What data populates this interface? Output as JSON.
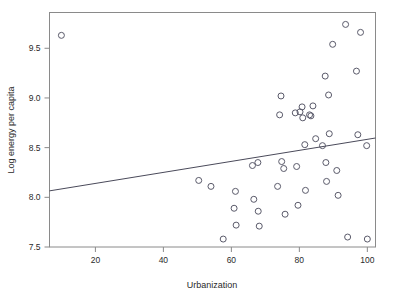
{
  "chart_data": {
    "type": "scatter",
    "title": "",
    "xlabel": "Urbanization",
    "ylabel": "Log energy per capita",
    "xlim": [
      6.5,
      102.4
    ],
    "ylim": [
      7.5,
      9.86
    ],
    "grid": false,
    "legend": null,
    "xticks": [
      20,
      40,
      60,
      80,
      100
    ],
    "xtick_labels": [
      "20",
      "40",
      "60",
      "80",
      "100"
    ],
    "yticks": [
      7.5,
      8.0,
      8.5,
      9.0,
      9.5
    ],
    "ytick_labels": [
      "7.5",
      "8.0",
      "8.5",
      "9.0",
      "9.5"
    ],
    "marker": "open-circle",
    "marker_color": "#5a5a6a",
    "line_color": "#4a4a5a",
    "points": [
      {
        "x": 10.0,
        "y": 9.63
      },
      {
        "x": 50.4,
        "y": 8.17
      },
      {
        "x": 54.0,
        "y": 8.11
      },
      {
        "x": 57.6,
        "y": 7.58
      },
      {
        "x": 60.8,
        "y": 7.89
      },
      {
        "x": 61.2,
        "y": 8.06
      },
      {
        "x": 61.4,
        "y": 7.72
      },
      {
        "x": 66.2,
        "y": 8.32
      },
      {
        "x": 66.6,
        "y": 7.98
      },
      {
        "x": 67.8,
        "y": 8.35
      },
      {
        "x": 67.9,
        "y": 7.86
      },
      {
        "x": 68.2,
        "y": 7.71
      },
      {
        "x": 73.6,
        "y": 8.11
      },
      {
        "x": 74.2,
        "y": 8.83
      },
      {
        "x": 74.6,
        "y": 9.02
      },
      {
        "x": 74.8,
        "y": 8.36
      },
      {
        "x": 75.4,
        "y": 8.29
      },
      {
        "x": 75.8,
        "y": 7.83
      },
      {
        "x": 78.8,
        "y": 8.85
      },
      {
        "x": 79.2,
        "y": 8.31
      },
      {
        "x": 79.6,
        "y": 7.92
      },
      {
        "x": 80.2,
        "y": 8.86
      },
      {
        "x": 80.8,
        "y": 8.91
      },
      {
        "x": 81.0,
        "y": 8.8
      },
      {
        "x": 81.6,
        "y": 8.53
      },
      {
        "x": 81.8,
        "y": 8.07
      },
      {
        "x": 83.0,
        "y": 8.83
      },
      {
        "x": 83.4,
        "y": 8.82
      },
      {
        "x": 84.0,
        "y": 8.92
      },
      {
        "x": 84.8,
        "y": 8.59
      },
      {
        "x": 86.8,
        "y": 8.52
      },
      {
        "x": 87.6,
        "y": 9.22
      },
      {
        "x": 87.8,
        "y": 8.35
      },
      {
        "x": 88.0,
        "y": 8.16
      },
      {
        "x": 88.6,
        "y": 9.03
      },
      {
        "x": 88.8,
        "y": 8.64
      },
      {
        "x": 89.8,
        "y": 9.54
      },
      {
        "x": 91.0,
        "y": 8.27
      },
      {
        "x": 91.4,
        "y": 8.02
      },
      {
        "x": 93.6,
        "y": 9.74
      },
      {
        "x": 94.2,
        "y": 7.6
      },
      {
        "x": 96.8,
        "y": 9.27
      },
      {
        "x": 97.2,
        "y": 8.63
      },
      {
        "x": 98.0,
        "y": 9.66
      },
      {
        "x": 99.8,
        "y": 8.52
      },
      {
        "x": 100.0,
        "y": 7.58
      }
    ],
    "fit_line": {
      "x0": 6.5,
      "y0": 8.065,
      "x1": 102.4,
      "y1": 8.597
    }
  }
}
